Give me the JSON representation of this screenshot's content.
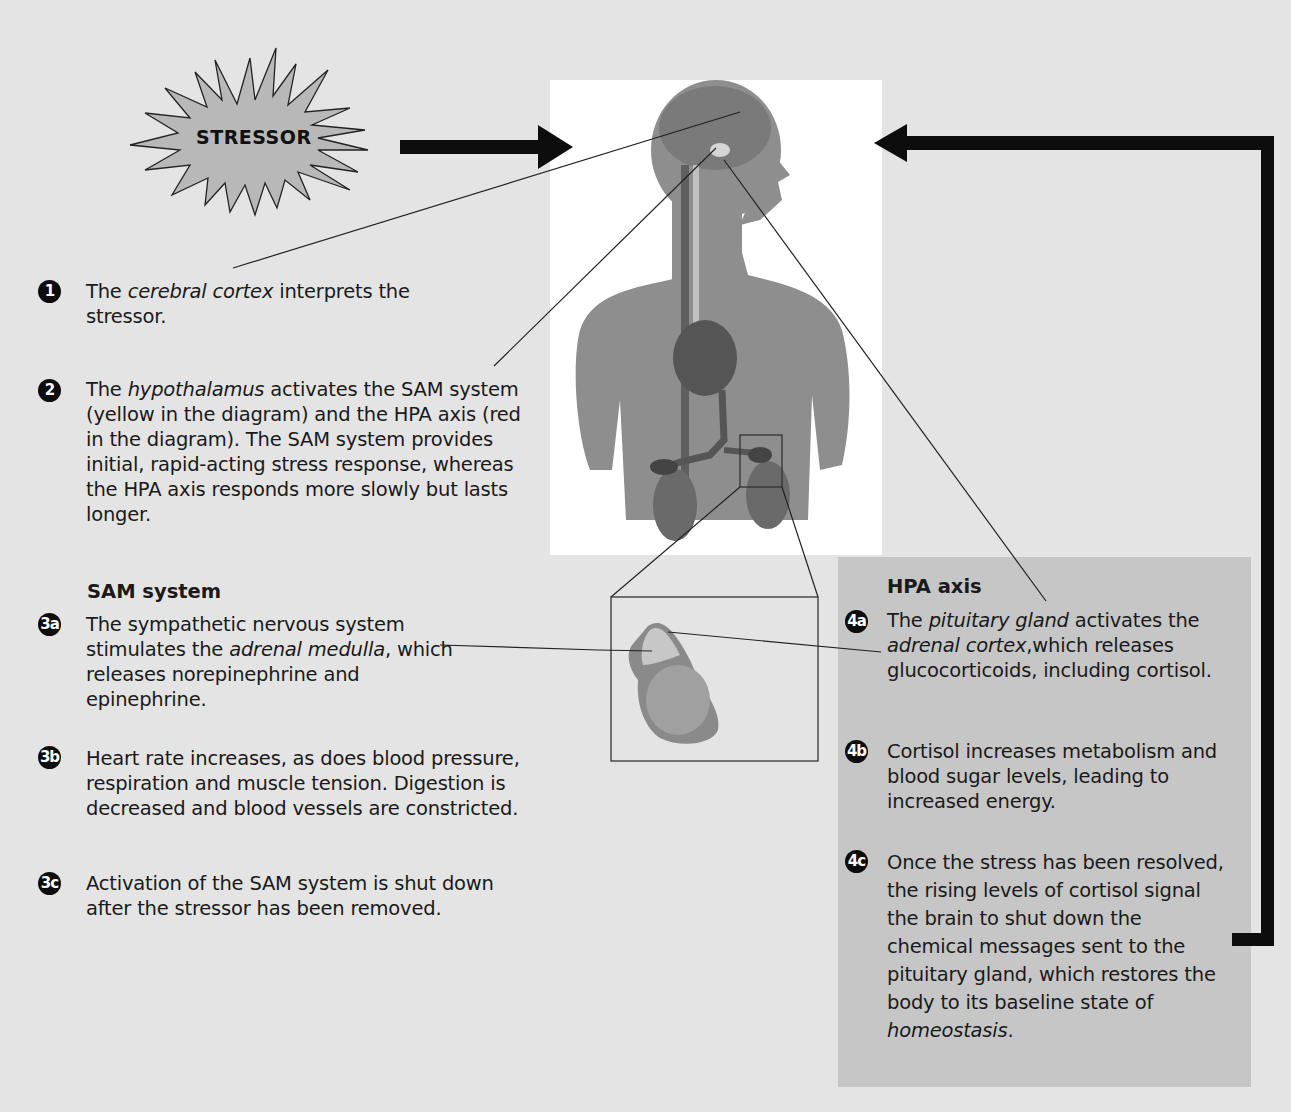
{
  "stressor": {
    "label": "STRESSOR"
  },
  "steps": {
    "s1": {
      "badge": "1",
      "pre": "The ",
      "em": "cerebral cortex",
      "post": " interprets the stressor."
    },
    "s2": {
      "badge": "2",
      "pre": "The ",
      "em": "hypothalamus",
      "post": " activates the SAM system (yellow in the diagram) and the HPA axis (red in the diagram). The SAM system provides initial, rapid-acting stress response, whereas the HPA axis responds more slowly but lasts longer."
    }
  },
  "sam": {
    "heading": "SAM system",
    "s3a": {
      "badge": "3a",
      "pre": "The sympathetic nervous system stimulates the ",
      "em": "adrenal medulla",
      "post": ", which releases norepinephrine and epinephrine."
    },
    "s3b": {
      "badge": "3b",
      "text": "Heart rate increases, as does blood pressure, respiration and muscle tension. Digestion is decreased and blood vessels are constricted."
    },
    "s3c": {
      "badge": "3c",
      "text": "Activation of the SAM system is shut down after the stressor has been removed."
    }
  },
  "hpa": {
    "heading": "HPA axis",
    "s4a": {
      "badge": "4a",
      "pre": "The ",
      "em1": "pituitary gland",
      "mid": " activates the ",
      "em2": "adrenal cortex",
      "post": ",which releases glucocorticoids, including cortisol."
    },
    "s4b": {
      "badge": "4b",
      "text": "Cortisol increases metabolism and blood sugar levels, leading to increased energy."
    },
    "s4c": {
      "badge": "4c",
      "pre": "Once the stress has been resolved, the rising levels of cortisol signal the brain to shut down the chemical messages sent to the pituitary gland, which restores the body to its baseline state of ",
      "em": "homeostasis",
      "post": "."
    }
  },
  "colors": {
    "background": "#e4e4e4",
    "figure_background": "#ffffff",
    "hpa_panel": "#c6c6c6",
    "arrow": "#0d0d0d",
    "badge": "#0d0d0d",
    "stressor_fill": "#b8b8b8"
  }
}
